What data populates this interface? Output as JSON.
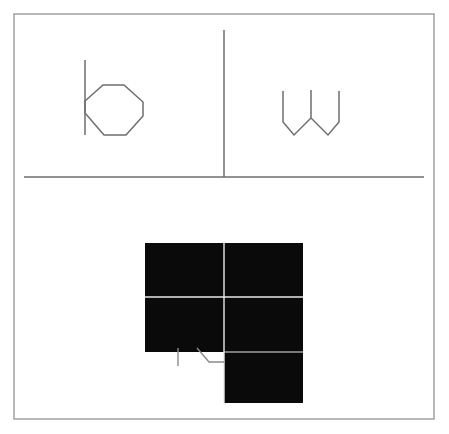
{
  "figure": {
    "title": "Scanned line-drawing figure with two upper panels and a lower inverted (black) panel",
    "width": 449,
    "height": 434,
    "background_color": "#ffffff",
    "ink_color": "#6e6e6e",
    "fill_color": "#0a0a0a",
    "white_rule_color": "#e8e8e8"
  },
  "frame": {
    "name": "outer-border",
    "x": 14,
    "y": 14,
    "width": 420,
    "height": 405,
    "stroke": "#9a9a9a",
    "stroke_width": 1.4
  },
  "rules": [
    {
      "name": "vertical-divider-top",
      "orientation": "vertical",
      "x": 224,
      "y1": 30,
      "y2": 177,
      "stroke": "#6e6e6e",
      "stroke_width": 1.5
    },
    {
      "name": "horizontal-divider-mid",
      "orientation": "horizontal",
      "y": 177,
      "x1": 24,
      "x2": 424,
      "stroke": "#6e6e6e",
      "stroke_width": 1.4
    }
  ],
  "shapes": {
    "hexagon_with_stem": {
      "name": "hexagon-with-vertical-stem",
      "panel": "top-left",
      "stem": {
        "x": 85,
        "y1": 60,
        "y2": 135
      },
      "polygon_points": "85,101 85,113 104,135 126,135 143,116 143,102 124,85 103,85",
      "stroke": "#6e6e6e",
      "stroke_width": 1.5,
      "fill": "none"
    },
    "w_zigzag": {
      "name": "w-zigzag-polyline",
      "panel": "top-right",
      "points": "283,91 283,122 294,135 311,118 311,90 311,118 328,135 339,122 339,91",
      "stroke": "#6e6e6e",
      "stroke_width": 1.5,
      "fill": "none"
    },
    "inverted_block": {
      "name": "inverted-black-block",
      "panel": "bottom",
      "left_column": {
        "x": 145,
        "y": 243,
        "width": 79,
        "height": 109
      },
      "right_column": {
        "x": 224,
        "y": 243,
        "width": 79,
        "height": 160
      },
      "fill": "#0a0a0a"
    },
    "white_rules_in_block": [
      {
        "name": "white-vertical-rule",
        "orientation": "vertical",
        "x": 224,
        "y1": 243,
        "y2": 403,
        "stroke": "#e8e8e8",
        "stroke_width": 1.4
      },
      {
        "name": "white-horizontal-rule",
        "orientation": "horizontal",
        "y": 297,
        "x1": 145,
        "x2": 303,
        "stroke": "#e8e8e8",
        "stroke_width": 1.4
      },
      {
        "name": "white-horizontal-rule-lower",
        "orientation": "horizontal",
        "y": 352,
        "x1": 224,
        "x2": 303,
        "stroke": "#e8e8e8",
        "stroke_width": 1.2
      }
    ],
    "outline_remnant": {
      "name": "outline-remnant-below-block",
      "stem": {
        "x": 178,
        "y1": 348,
        "y2": 366
      },
      "polyline_points": "197,348 209,362 224,362",
      "stroke": "#8a8a8a",
      "stroke_width": 1.4,
      "fill": "none"
    }
  }
}
